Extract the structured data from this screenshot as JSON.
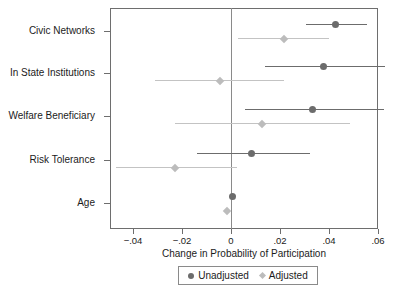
{
  "chart_data": {
    "type": "scatter",
    "title": "",
    "xlabel": "Change in Probability of Participation",
    "ylabel": "",
    "xlim": [
      -0.0494,
      0.06
    ],
    "xticks": [
      -0.04,
      -0.02,
      0,
      0.02,
      0.04,
      0.06
    ],
    "xticklabels": [
      "−.04",
      "−.02",
      "0",
      ".02",
      ".04",
      ".06"
    ],
    "categories": [
      "Civic Networks",
      "In State Institutions",
      "Welfare Beneficiary",
      "Risk Tolerance",
      "Age"
    ],
    "grid": false,
    "legend_position": "bottom",
    "reference_line": 0,
    "series": [
      {
        "name": "Unadjusted",
        "marker": "circle",
        "color": "#6c6c6c",
        "values": [
          0.0425,
          0.0376,
          0.0334,
          0.0085,
          0.0007
        ],
        "ci_low": [
          0.0306,
          0.0138,
          0.0058,
          -0.0139,
          0.0002
        ],
        "ci_high": [
          0.0554,
          0.0628,
          0.0624,
          0.0322,
          0.0012
        ]
      },
      {
        "name": "Adjusted",
        "marker": "diamond",
        "color": "#bcbcbc",
        "values": [
          0.0216,
          -0.0045,
          0.0126,
          -0.0229,
          -0.0017
        ],
        "ci_low": [
          0.0029,
          -0.031,
          -0.0229,
          -0.0469,
          -0.0021
        ],
        "ci_high": [
          0.04,
          0.0216,
          0.0487,
          0.0025,
          -0.0012
        ]
      }
    ]
  },
  "legend": {
    "items": [
      {
        "label": "Unadjusted",
        "marker": "circle"
      },
      {
        "label": "Adjusted",
        "marker": "diamond"
      }
    ]
  }
}
